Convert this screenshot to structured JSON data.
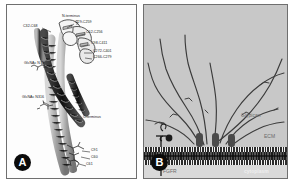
{
  "figure": {
    "panels": [
      {
        "id": "A",
        "badge": "A",
        "caption_letter": "A",
        "type": "protein-ribbon-structure",
        "labels": [
          {
            "name": "n-terminus",
            "text": "N-terminus",
            "x": 55,
            "y": 11
          },
          {
            "name": "disulfide-c29-c259",
            "text": "C29-C259",
            "x": 68,
            "y": 17
          },
          {
            "name": "disulfide-c32-c68",
            "text": "C32-C68",
            "x": 20,
            "y": 21
          },
          {
            "name": "disulfide-c62-c256",
            "text": "C62-C256",
            "x": 79,
            "y": 27
          },
          {
            "name": "disulfide-c98-c411",
            "text": "C98-C411",
            "x": 84,
            "y": 38
          },
          {
            "name": "disulfide-c272-c401",
            "text": "C272-C401",
            "x": 86,
            "y": 46
          },
          {
            "name": "disulfide-c266-c279",
            "text": "C266-C279",
            "x": 86,
            "y": 52
          },
          {
            "name": "glycan-n79",
            "text": "GlcNAc\nN79",
            "x": 22,
            "y": 58
          },
          {
            "name": "glycan-n316",
            "text": "GlcNAc\nN316",
            "x": 21,
            "y": 92
          },
          {
            "name": "c-terminus",
            "text": "C-terminus",
            "x": 76,
            "y": 112
          },
          {
            "name": "residue-c91",
            "text": "C91",
            "x": 84,
            "y": 145
          },
          {
            "name": "residue-c60",
            "text": "C60",
            "x": 84,
            "y": 152
          },
          {
            "name": "residue-c61",
            "text": "C61",
            "x": 79,
            "y": 159
          }
        ]
      },
      {
        "id": "B",
        "badge": "B",
        "caption_letter": "B",
        "type": "membrane-schematic",
        "labels": [
          {
            "name": "glypican-label",
            "text": "Glypican",
            "x": 97,
            "y": 110,
            "style": "grey"
          },
          {
            "name": "ecm-label",
            "text": "ECM",
            "x": 120,
            "y": 131,
            "style": "grey"
          },
          {
            "name": "fgfr-label",
            "text": "FGFR",
            "x": 19,
            "y": 165,
            "style": "grey"
          },
          {
            "name": "cytoplasm-label",
            "text": "cytoplasm",
            "x": 104,
            "y": 165,
            "style": "light"
          }
        ],
        "regions": {
          "extracellular": "ECM",
          "membrane": "lipid bilayer",
          "intracellular": "cytoplasm"
        },
        "glypican_count": 3,
        "receptor_count": 1,
        "gag_chain_count": 9
      }
    ]
  },
  "colors": {
    "panel_a_background": "#fdfdfd",
    "panel_b_background": "#c9c9c9",
    "cytoplasm_background": "#d9d9d9",
    "membrane": "#2b2b2b",
    "badge": "#0b0b0b",
    "badge_text": "#ffffff",
    "label_text": "#171717",
    "panel_b_label_text": "#6a6a6a",
    "chain_stroke": "#3b3b3b",
    "border": "#6f6f6f"
  }
}
